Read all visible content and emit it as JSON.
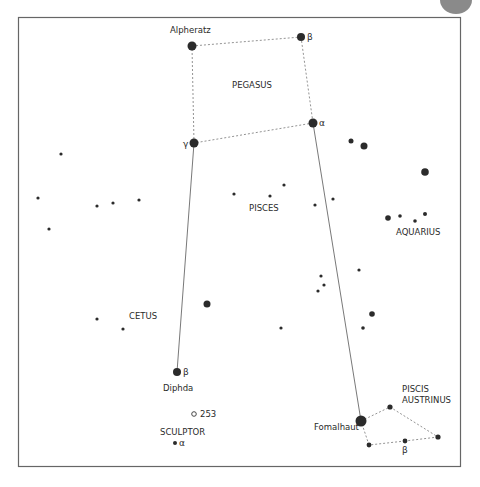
{
  "colors": {
    "star": "#2b2b2b",
    "frame": "#666666",
    "dotted": "#777777",
    "line": "#555555"
  },
  "constellations": [
    {
      "id": "pegasus",
      "label": "PEGASUS"
    },
    {
      "id": "pisces",
      "label": "PISCES"
    },
    {
      "id": "aquarius",
      "label": "AQUARIUS"
    },
    {
      "id": "cetus",
      "label": "CETUS"
    },
    {
      "id": "sculptor",
      "label": "SCULPTOR"
    },
    {
      "id": "piscis-austrinus",
      "label_line1": "PISCIS",
      "label_line2": "AUSTRINUS"
    }
  ],
  "named_stars": [
    {
      "id": "alpheratz",
      "name": "Alpheratz",
      "size": "large"
    },
    {
      "id": "pegasus-beta",
      "greek": "β",
      "size": "large"
    },
    {
      "id": "pegasus-alpha",
      "greek": "α",
      "size": "large"
    },
    {
      "id": "pegasus-gamma",
      "greek": "γ",
      "size": "large"
    },
    {
      "id": "diphda",
      "name": "Diphda",
      "greek": "β",
      "size": "large"
    },
    {
      "id": "fomalhaut",
      "name": "Fomalhaut",
      "size": "largest"
    },
    {
      "id": "sculptor-alpha",
      "greek": "α",
      "size": "small"
    },
    {
      "id": "piscis-austrinus-beta",
      "greek": "β",
      "size": "small"
    }
  ],
  "deep_sky": [
    {
      "id": "ngc253",
      "label": "253",
      "symbol": "open-circle"
    }
  ],
  "asterism_dotted": [
    [
      "alpheratz",
      "pegasus-beta"
    ],
    [
      "pegasus-beta",
      "pegasus-alpha"
    ],
    [
      "pegasus-alpha",
      "pegasus-gamma"
    ],
    [
      "pegasus-gamma",
      "alpheratz"
    ],
    [
      "fomalhaut",
      "pa-1"
    ],
    [
      "pa-1",
      "pa-3"
    ],
    [
      "pa-3",
      "piscis-austrinus-beta"
    ],
    [
      "piscis-austrinus-beta",
      "pa-2"
    ],
    [
      "pa-2",
      "fomalhaut"
    ]
  ],
  "pointer_lines": [
    [
      "pegasus-gamma",
      "diphda"
    ],
    [
      "pegasus-alpha",
      "fomalhaut"
    ]
  ]
}
